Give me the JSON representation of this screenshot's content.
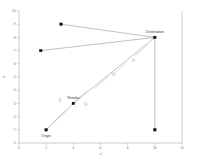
{
  "chart_data": {
    "type": "scatter",
    "title": "",
    "subtitle": "",
    "xlabel": "x",
    "ylabel": "y",
    "xlim": [
      0,
      12
    ],
    "ylim": [
      0,
      10
    ],
    "grid": false,
    "legend_position": "none",
    "x_ticks": [
      "0",
      "2",
      "4",
      "6",
      "8",
      "10",
      "12"
    ],
    "y_ticks": [
      "0",
      "1",
      "2",
      "3",
      "4",
      "5",
      "6",
      "7",
      "8",
      "9",
      "10"
    ],
    "points": [
      {
        "id": "origin",
        "label": "Origin",
        "x": 2,
        "y": 1,
        "label_dx": 0,
        "label_dy": 7
      },
      {
        "id": "retailer",
        "label": "Retailer",
        "x": 4,
        "y": 3,
        "label_dx": 0,
        "label_dy": -4
      },
      {
        "id": "destination",
        "label": "Destination",
        "x": 10,
        "y": 8,
        "label_dx": 0,
        "label_dy": -4
      },
      {
        "id": "node-upper",
        "label": "",
        "x": 3.1,
        "y": 9,
        "label_dx": 0,
        "label_dy": 0
      },
      {
        "id": "node-left",
        "label": "",
        "x": 1.6,
        "y": 7,
        "label_dx": 0,
        "label_dy": 0
      },
      {
        "id": "node-lower",
        "label": "",
        "x": 10,
        "y": 1,
        "label_dx": 0,
        "label_dy": 0
      }
    ],
    "edges": [
      {
        "id": "origin-retailer",
        "from": "origin",
        "to": "retailer"
      },
      {
        "id": "retailer-destination",
        "from": "retailer",
        "to": "destination"
      },
      {
        "id": "upper-destination",
        "from": "node-upper",
        "to": "destination"
      },
      {
        "id": "left-destination",
        "from": "node-left",
        "to": "destination"
      },
      {
        "id": "destination-lower",
        "from": "destination",
        "to": "node-lower"
      }
    ],
    "flow_labels": [
      {
        "id": "q1",
        "text": "Q₁",
        "x": 3.05,
        "y": 3.15
      },
      {
        "id": "q2",
        "text": "Q₂",
        "x": 4.95,
        "y": 2.85
      },
      {
        "id": "q3",
        "text": "Q₃",
        "x": 6.95,
        "y": 5.15
      },
      {
        "id": "q4",
        "text": "Q₄",
        "x": 8.45,
        "y": 6.25
      }
    ],
    "hash_marks": [
      {
        "id": "hash-1",
        "x": 3.0,
        "y": 2.0
      },
      {
        "id": "hash-2",
        "x": 4.55,
        "y": 3.55
      },
      {
        "id": "hash-3",
        "x": 6.1,
        "y": 4.6
      },
      {
        "id": "hash-4",
        "x": 7.5,
        "y": 5.7
      },
      {
        "id": "hash-5",
        "x": 9.0,
        "y": 7.0
      }
    ]
  },
  "colors": {
    "marker": "#0d0d0d",
    "route": "#777777",
    "axis": "#9a9a9a",
    "hash": "#b0b0b0",
    "label": "#3a3a3a",
    "background": "#ffffff"
  }
}
